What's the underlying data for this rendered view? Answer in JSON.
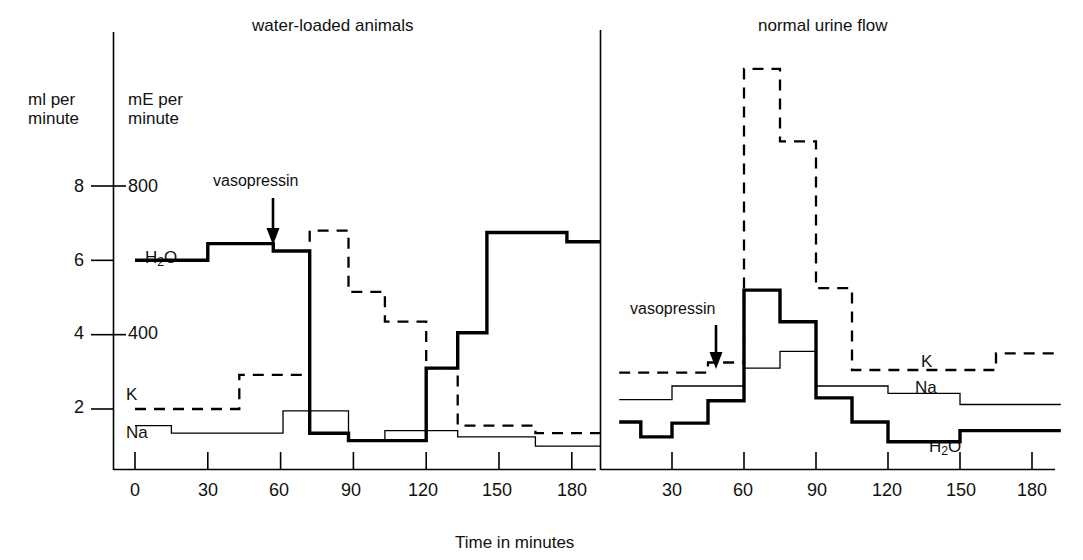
{
  "figure": {
    "axis_units": {
      "left": "ml per\nminute",
      "right": "mE per\nminute"
    },
    "x_caption": "Time in minutes",
    "panels": [
      {
        "title": "water-loaded animals",
        "annotation": "vasopressin"
      },
      {
        "title": "normal urine flow",
        "annotation": "vasopressin"
      }
    ],
    "series_labels": {
      "water": "H₂O",
      "potassium": "K",
      "sodium": "Na"
    },
    "colors": {
      "ink": "#000000",
      "background": "#ffffff"
    }
  },
  "chart_data": {
    "type": "line",
    "subtitle": "Step (staircase) plot, two panels sharing one time axis",
    "xlabel": "Time in minutes",
    "ylabel_left": "ml per minute",
    "ylabel_right": "mE per minute",
    "left_axis_ticks": [
      2,
      4,
      6,
      8
    ],
    "right_axis_ticks": [
      null,
      400,
      null,
      800
    ],
    "right_axis_tick_labels": [
      "",
      "400",
      "",
      "800"
    ],
    "left_axis_tick_labels": [
      "2",
      "4",
      "6",
      "8"
    ],
    "ylim": [
      0,
      9.2
    ],
    "grid": false,
    "legend": "inline-series-labels",
    "x_tick_labels_panel1": [
      "0",
      "30",
      "60",
      "90",
      "120",
      "150",
      "180"
    ],
    "x_tick_values_panel1": [
      0,
      30,
      60,
      90,
      120,
      150,
      180
    ],
    "x_tick_labels_panel2": [
      "30",
      "60",
      "90",
      "120",
      "150",
      "180"
    ],
    "x_tick_values_panel2": [
      30,
      60,
      90,
      120,
      150,
      180
    ],
    "xlim_panel1": [
      0,
      192
    ],
    "xlim_panel2": [
      8,
      192
    ],
    "annotations": [
      {
        "panel": 1,
        "text": "vasopressin",
        "x": 57,
        "y": 8.0
      },
      {
        "panel": 2,
        "text": "vasopressin",
        "x": 48,
        "y": 4.7
      }
    ],
    "panels": [
      {
        "name": "water-loaded animals",
        "series": [
          {
            "name": "H2O",
            "label": "H₂O",
            "style": "solid-thick",
            "unit": "ml per minute",
            "steps": [
              {
                "x0": 0,
                "x1": 30,
                "y": 6.0
              },
              {
                "x0": 30,
                "x1": 57,
                "y": 6.45
              },
              {
                "x0": 57,
                "x1": 72,
                "y": 6.25
              },
              {
                "x0": 72,
                "x1": 88,
                "y": 1.35
              },
              {
                "x0": 88,
                "x1": 120,
                "y": 1.15
              },
              {
                "x0": 120,
                "x1": 133,
                "y": 3.1
              },
              {
                "x0": 133,
                "x1": 145,
                "y": 4.05
              },
              {
                "x0": 145,
                "x1": 178,
                "y": 6.75
              },
              {
                "x0": 178,
                "x1": 192,
                "y": 6.5
              }
            ]
          },
          {
            "name": "K",
            "label": "K",
            "style": "dashed",
            "unit": "mE per minute",
            "steps": [
              {
                "x0": 0,
                "x1": 43,
                "y": 2.0
              },
              {
                "x0": 43,
                "x1": 72,
                "y": 2.92
              },
              {
                "x0": 72,
                "x1": 88,
                "y": 6.8
              },
              {
                "x0": 88,
                "x1": 103,
                "y": 5.15
              },
              {
                "x0": 103,
                "x1": 120,
                "y": 4.35
              },
              {
                "x0": 120,
                "x1": 133,
                "y": 3.1
              },
              {
                "x0": 133,
                "x1": 165,
                "y": 1.55
              },
              {
                "x0": 165,
                "x1": 192,
                "y": 1.35
              }
            ]
          },
          {
            "name": "Na",
            "label": "Na",
            "style": "solid-thin",
            "unit": "mE per minute",
            "steps": [
              {
                "x0": 0,
                "x1": 15,
                "y": 1.55
              },
              {
                "x0": 15,
                "x1": 61,
                "y": 1.35
              },
              {
                "x0": 61,
                "x1": 88,
                "y": 1.95
              },
              {
                "x0": 88,
                "x1": 103,
                "y": 1.15
              },
              {
                "x0": 103,
                "x1": 133,
                "y": 1.42
              },
              {
                "x0": 133,
                "x1": 165,
                "y": 1.25
              },
              {
                "x0": 165,
                "x1": 192,
                "y": 1.0
              }
            ]
          }
        ]
      },
      {
        "name": "normal urine flow",
        "series": [
          {
            "name": "H2O",
            "label": "H₂O",
            "style": "solid-thick",
            "unit": "ml per minute",
            "steps": [
              {
                "x0": 8,
                "x1": 17,
                "y": 1.65
              },
              {
                "x0": 17,
                "x1": 30,
                "y": 1.25
              },
              {
                "x0": 30,
                "x1": 45,
                "y": 1.62
              },
              {
                "x0": 45,
                "x1": 60,
                "y": 2.22
              },
              {
                "x0": 60,
                "x1": 75,
                "y": 5.2
              },
              {
                "x0": 75,
                "x1": 90,
                "y": 4.35
              },
              {
                "x0": 90,
                "x1": 105,
                "y": 2.3
              },
              {
                "x0": 105,
                "x1": 120,
                "y": 1.65
              },
              {
                "x0": 120,
                "x1": 150,
                "y": 1.12
              },
              {
                "x0": 150,
                "x1": 192,
                "y": 1.42
              }
            ]
          },
          {
            "name": "K",
            "label": "K",
            "style": "dashed",
            "unit": "mE per minute",
            "steps": [
              {
                "x0": 8,
                "x1": 45,
                "y": 2.98
              },
              {
                "x0": 45,
                "x1": 60,
                "y": 3.25
              },
              {
                "x0": 60,
                "x1": 75,
                "y": 11.15
              },
              {
                "x0": 75,
                "x1": 90,
                "y": 9.2
              },
              {
                "x0": 90,
                "x1": 105,
                "y": 5.25
              },
              {
                "x0": 105,
                "x1": 165,
                "y": 3.05
              },
              {
                "x0": 165,
                "x1": 192,
                "y": 3.5
              }
            ]
          },
          {
            "name": "Na",
            "label": "Na",
            "style": "solid-thin",
            "unit": "mE per minute",
            "steps": [
              {
                "x0": 8,
                "x1": 30,
                "y": 2.25
              },
              {
                "x0": 30,
                "x1": 60,
                "y": 2.62
              },
              {
                "x0": 60,
                "x1": 75,
                "y": 3.1
              },
              {
                "x0": 75,
                "x1": 90,
                "y": 3.55
              },
              {
                "x0": 90,
                "x1": 120,
                "y": 2.62
              },
              {
                "x0": 120,
                "x1": 150,
                "y": 2.42
              },
              {
                "x0": 150,
                "x1": 192,
                "y": 2.12
              }
            ]
          }
        ]
      }
    ]
  }
}
